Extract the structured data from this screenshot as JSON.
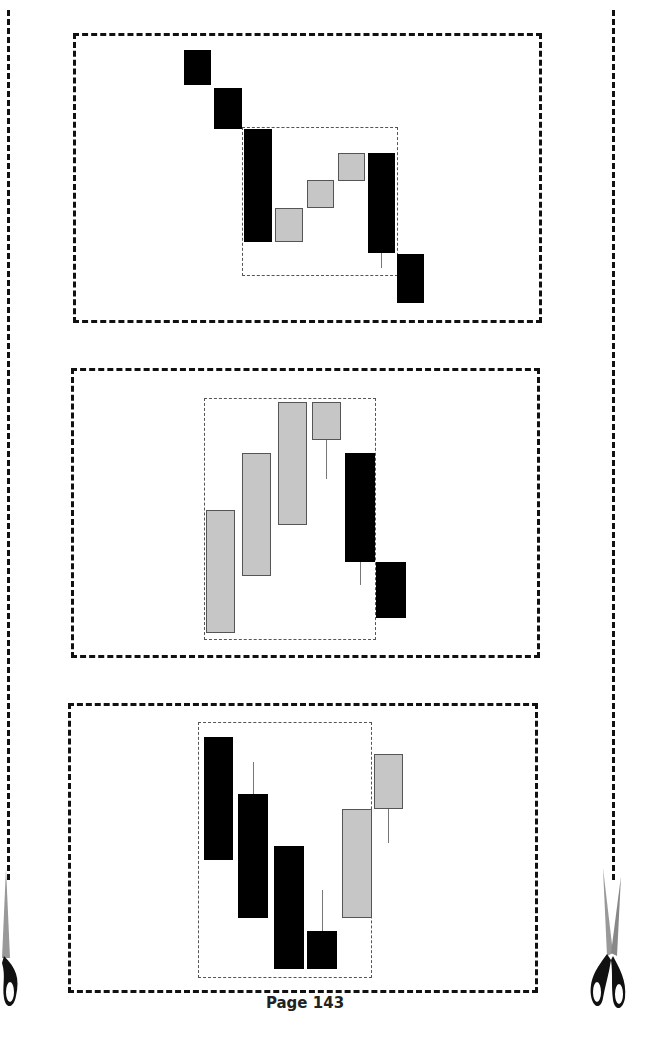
{
  "page": {
    "label": "Page 143"
  },
  "colors": {
    "bearish": "#000000",
    "bullish": "#c6c6c6",
    "outline": "#111111",
    "inner_box": "#555555"
  },
  "icons": {
    "scissors_left": "scissors-icon",
    "scissors_right": "scissors-icon"
  },
  "chart_data": [
    {
      "type": "candlestick",
      "title": "",
      "panel_box": [
        73,
        33,
        542,
        323
      ],
      "highlight_box": [
        242,
        127,
        398,
        276
      ],
      "candles": [
        {
          "x": 184,
          "w": 27,
          "top": 50,
          "bottom": 85,
          "color": "bear"
        },
        {
          "x": 214,
          "w": 28,
          "top": 88,
          "bottom": 129,
          "color": "bear"
        },
        {
          "x": 244,
          "w": 28,
          "top": 129,
          "bottom": 242,
          "color": "bear"
        },
        {
          "x": 275,
          "w": 28,
          "top": 208,
          "bottom": 242,
          "color": "bull"
        },
        {
          "x": 307,
          "w": 27,
          "top": 180,
          "bottom": 208,
          "color": "bull"
        },
        {
          "x": 338,
          "w": 27,
          "top": 153,
          "bottom": 181,
          "color": "bull"
        },
        {
          "x": 368,
          "w": 27,
          "top": 153,
          "bottom": 253,
          "color": "bear",
          "wick_low": 268
        },
        {
          "x": 397,
          "w": 27,
          "top": 254,
          "bottom": 303,
          "color": "bear"
        }
      ]
    },
    {
      "type": "candlestick",
      "title": "",
      "panel_box": [
        71,
        368,
        540,
        658
      ],
      "highlight_box": [
        204,
        398,
        376,
        640
      ],
      "candles": [
        {
          "x": 206,
          "w": 29,
          "top": 510,
          "bottom": 633,
          "color": "bull"
        },
        {
          "x": 242,
          "w": 29,
          "top": 453,
          "bottom": 576,
          "color": "bull"
        },
        {
          "x": 278,
          "w": 29,
          "top": 402,
          "bottom": 525,
          "color": "bull"
        },
        {
          "x": 312,
          "w": 29,
          "top": 402,
          "bottom": 440,
          "color": "bull",
          "wick_low": 479
        },
        {
          "x": 345,
          "w": 30,
          "top": 453,
          "bottom": 562,
          "color": "bear",
          "wick_low": 585
        },
        {
          "x": 376,
          "w": 30,
          "top": 562,
          "bottom": 618,
          "color": "bear"
        }
      ]
    },
    {
      "type": "candlestick",
      "title": "",
      "panel_box": [
        68,
        703,
        538,
        993
      ],
      "highlight_box": [
        198,
        722,
        372,
        978
      ],
      "candles": [
        {
          "x": 204,
          "w": 29,
          "top": 737,
          "bottom": 860,
          "color": "bear"
        },
        {
          "x": 238,
          "w": 30,
          "top": 794,
          "bottom": 918,
          "color": "bear",
          "wick_high": 762
        },
        {
          "x": 274,
          "w": 30,
          "top": 846,
          "bottom": 969,
          "color": "bear"
        },
        {
          "x": 307,
          "w": 30,
          "top": 931,
          "bottom": 969,
          "color": "bear",
          "wick_high": 890
        },
        {
          "x": 342,
          "w": 30,
          "top": 809,
          "bottom": 918,
          "color": "bull"
        },
        {
          "x": 374,
          "w": 29,
          "top": 754,
          "bottom": 809,
          "color": "bull",
          "wick_low": 843
        }
      ]
    }
  ]
}
